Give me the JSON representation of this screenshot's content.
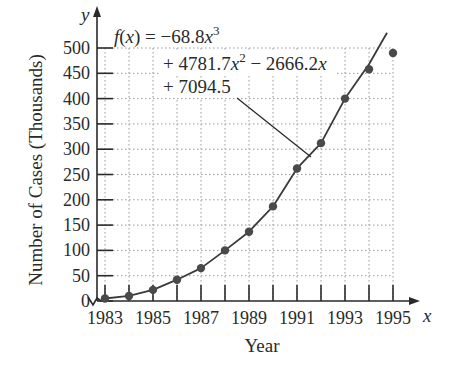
{
  "chart_data": {
    "type": "scatter",
    "title": "",
    "xlabel": "Year",
    "ylabel": "Number of Cases (Thousands)",
    "x_axis_var": "x",
    "y_axis_var": "y",
    "x_tick_labels": [
      "1983",
      "1985",
      "1987",
      "1989",
      "1991",
      "1993",
      "1995"
    ],
    "y_tick_labels": [
      "0",
      "50",
      "100",
      "150",
      "200",
      "250",
      "300",
      "350",
      "400",
      "450",
      "500"
    ],
    "xlim": [
      1983,
      1995
    ],
    "ylim": [
      0,
      500
    ],
    "grid": true,
    "legend": null,
    "series": [
      {
        "name": "Data points",
        "type": "scatter",
        "x": [
          1983,
          1984,
          1985,
          1986,
          1987,
          1988,
          1989,
          1990,
          1991,
          1992,
          1993,
          1994,
          1995
        ],
        "values": [
          5,
          10,
          22,
          42,
          65,
          100,
          137,
          187,
          262,
          312,
          400,
          458,
          490
        ]
      },
      {
        "name": "Cubic model",
        "type": "line",
        "equation": "f(x) = -68.8x^3 + 4781.7x^2 - 2666.2x + 7094.5"
      }
    ],
    "annotations": [
      {
        "line1": "f(x) = −68.8x",
        "sup1": "3",
        "line2a": "+ 4781.7x",
        "sup2": "2",
        "line2b": " − 2666.2x",
        "line3": "+ 7094.5"
      }
    ]
  }
}
